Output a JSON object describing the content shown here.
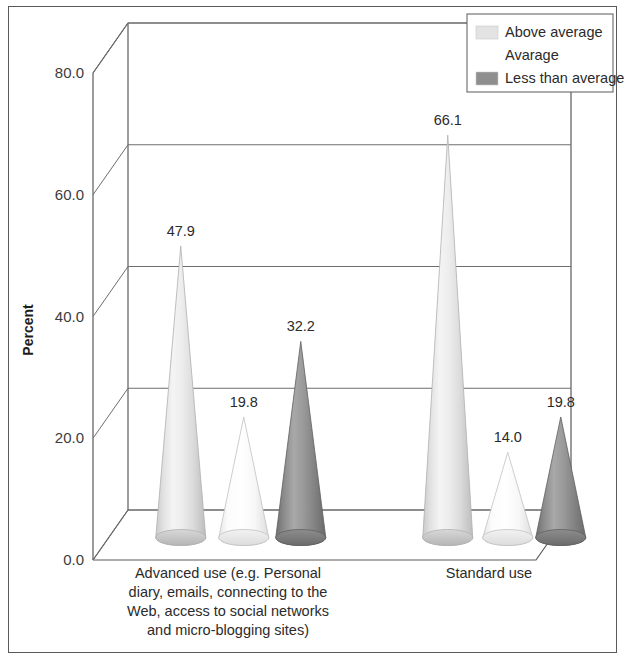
{
  "chart_data": {
    "type": "bar",
    "title": "",
    "subtitle": "",
    "xlabel": "",
    "ylabel": "Percent",
    "ylim": [
      0,
      80
    ],
    "yticks": [
      "0.0",
      "20.0",
      "40.0",
      "60.0",
      "80.0"
    ],
    "ytick_values": [
      0,
      20,
      40,
      60,
      80
    ],
    "grid": true,
    "style": "3d-cone",
    "legend_position": "top-right",
    "categories": [
      "Advanced use (e.g. Personal diary, emails, connecting to the Web, access to social networks and micro-blogging sites)",
      "Standard use"
    ],
    "category_lines": [
      [
        "Advanced use (e.g. Personal",
        "diary, emails, connecting to the",
        "Web, access to social networks",
        "and micro-blogging sites)"
      ],
      [
        "Standard use"
      ]
    ],
    "series": [
      {
        "name": "Above average",
        "color": "#e9e9e9",
        "values": [
          47.9,
          66.1
        ],
        "labels": [
          "47.9",
          "66.1"
        ]
      },
      {
        "name": "Avarage",
        "color": "#fdfdfd",
        "values": [
          19.8,
          14.0
        ],
        "labels": [
          "19.8",
          "14.0"
        ]
      },
      {
        "name": "Less than average",
        "color": "#8e8e8e",
        "values": [
          32.2,
          19.8
        ],
        "labels": [
          "32.2",
          "19.8"
        ]
      }
    ]
  },
  "legend": {
    "items": [
      {
        "label": "Above average",
        "color": "#e3e3e3",
        "swatch_visible": true
      },
      {
        "label": "Avarage",
        "color": "#ffffff",
        "swatch_visible": false
      },
      {
        "label": "Less than average",
        "color": "#8e8e8e",
        "swatch_visible": true
      }
    ]
  },
  "axes": {
    "y_title": "Percent",
    "y_ticks": [
      "80.0",
      "60.0",
      "40.0",
      "20.0",
      "0.0"
    ]
  },
  "colors": {
    "frame_border": "#5a5a5a",
    "grid": "#6e6e6e",
    "text": "#2b2b2b",
    "background": "#ffffff"
  }
}
